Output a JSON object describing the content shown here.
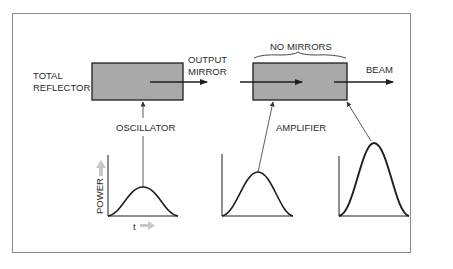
{
  "labels": {
    "total_reflector_line1": "TOTAL",
    "total_reflector_line2": "REFLECTOR",
    "output_mirror_line1": "OUTPUT",
    "output_mirror_line2": "MIRROR",
    "no_mirrors": "NO MIRRORS",
    "beam": "BEAM",
    "oscillator": "OSCILLATOR",
    "amplifier": "AMPLIFIER",
    "power_axis": "POWER",
    "time_axis": "t"
  },
  "colors": {
    "box_fill": "#a9a9a9",
    "stroke": "#1e1e1e",
    "frame": "#8a8a8a",
    "axis_arrow": "#c8c8c8"
  },
  "pulses": [
    {
      "name": "oscillator-output",
      "relative_peak": 0.48
    },
    {
      "name": "amplifier-input",
      "relative_peak": 0.72
    },
    {
      "name": "amplified-output",
      "relative_peak": 1.2
    }
  ]
}
